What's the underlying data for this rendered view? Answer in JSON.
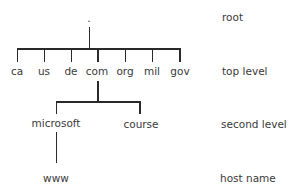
{
  "diagram": {
    "root": {
      "label": "."
    },
    "top_level": [
      "ca",
      "us",
      "de",
      "com",
      "org",
      "mil",
      "gov"
    ],
    "second_level": [
      "microsoft",
      "course"
    ],
    "host_name": [
      "www"
    ],
    "level_labels": {
      "root": "root",
      "top_level": "top level",
      "second_level": "second level",
      "host_name": "host name"
    }
  }
}
